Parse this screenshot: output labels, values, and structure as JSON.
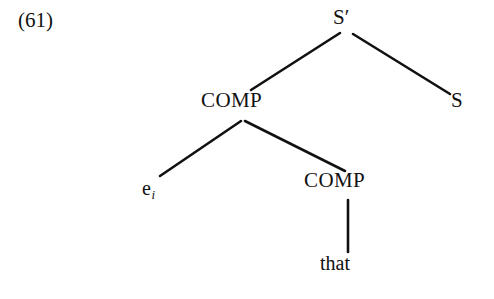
{
  "figure": {
    "example_number": "(61)",
    "background_color": "#ffffff",
    "line_color": "#111111",
    "text_color": "#111111"
  },
  "tree": {
    "nodes": {
      "root": {
        "label": "S",
        "prime": "′",
        "full_label": "S′",
        "category": "S-bar"
      },
      "s": {
        "label": "S",
        "category": "S"
      },
      "comp_upper": {
        "label": "COMP",
        "category": "COMP"
      },
      "comp_lower": {
        "label": "COMP",
        "category": "COMP"
      },
      "empty_category": {
        "label": "e",
        "index": "i",
        "full_label": "eᵢ",
        "category": "empty-category"
      },
      "terminal_that": {
        "label": "that",
        "category": "terminal"
      }
    },
    "edges": [
      {
        "name": "sbar-to-comp",
        "from": "root",
        "to": "comp_upper",
        "x1": 340,
        "y1": 33,
        "x2": 251,
        "y2": 90
      },
      {
        "name": "sbar-to-s",
        "from": "root",
        "to": "s",
        "x1": 353,
        "y1": 34,
        "x2": 450,
        "y2": 94
      },
      {
        "name": "comp-to-empty",
        "from": "comp_upper",
        "to": "empty_category",
        "x1": 241,
        "y1": 121,
        "x2": 160,
        "y2": 176
      },
      {
        "name": "comp-to-comp",
        "from": "comp_upper",
        "to": "comp_lower",
        "x1": 245,
        "y1": 121,
        "x2": 345,
        "y2": 171
      },
      {
        "name": "comp-to-that",
        "from": "comp_lower",
        "to": "terminal_that",
        "x1": 348,
        "y1": 200,
        "x2": 348,
        "y2": 252
      }
    ],
    "stroke_width": 2.6
  }
}
